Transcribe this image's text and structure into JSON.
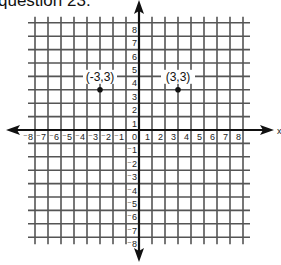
{
  "caption": "question 23:",
  "chart_data": {
    "type": "scatter",
    "title": "",
    "xlabel": "x",
    "ylabel": "",
    "xlim": [
      -8,
      8
    ],
    "ylim": [
      -8,
      8
    ],
    "grid": true,
    "x_ticks": [
      "-8",
      "-7",
      "-6",
      "-5",
      "-4",
      "-3",
      "-2",
      "-1",
      "0",
      "1",
      "2",
      "3",
      "4",
      "5",
      "6",
      "7",
      "8"
    ],
    "y_ticks": [
      "8",
      "7",
      "6",
      "5",
      "4",
      "3",
      "2",
      "1",
      "-1",
      "-2",
      "-3",
      "-4",
      "-5",
      "-6",
      "-7",
      "-8"
    ],
    "series": [
      {
        "name": "points",
        "points": [
          {
            "x": -3,
            "y": 3,
            "label": "(-3,3)"
          },
          {
            "x": 3,
            "y": 3,
            "label": "(3,3)"
          }
        ]
      }
    ]
  }
}
